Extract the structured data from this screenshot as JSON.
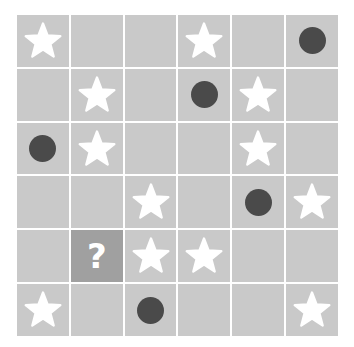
{
  "puzzle": {
    "type": "symbol-grid",
    "rows": 6,
    "columns": 6,
    "background_color": "#ffffff",
    "cell_color": "#c9c9c9",
    "gridline_color": "#ffffff",
    "highlight_cell_color": "#a0a0a0",
    "star_color": "#ffffff",
    "circle_color": "#4a4a4a",
    "question_mark_color": "#ffffff",
    "question_mark_label": "?",
    "symbol_names": {
      "star": "star-icon",
      "circle": "circle-icon",
      "question": "question-mark-icon",
      "empty": "empty-cell"
    },
    "cells": [
      [
        "star",
        "empty",
        "empty",
        "star",
        "empty",
        "circle"
      ],
      [
        "empty",
        "star",
        "empty",
        "circle",
        "star",
        "empty"
      ],
      [
        "circle",
        "star",
        "empty",
        "empty",
        "star",
        "empty"
      ],
      [
        "empty",
        "empty",
        "star",
        "empty",
        "circle",
        "star"
      ],
      [
        "empty",
        "question",
        "star",
        "star",
        "empty",
        "empty"
      ],
      [
        "star",
        "empty",
        "circle",
        "empty",
        "empty",
        "star"
      ]
    ]
  }
}
